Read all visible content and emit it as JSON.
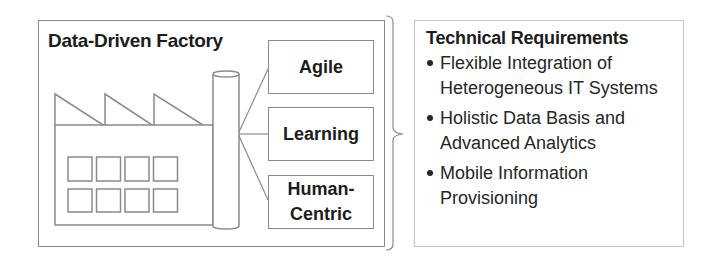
{
  "factory": {
    "title": "Data-Driven Factory",
    "icon": "factory-icon",
    "characteristics": [
      {
        "label": "Agile"
      },
      {
        "label": "Learning"
      },
      {
        "label": "Human-\nCentric"
      }
    ]
  },
  "requirements": {
    "title": "Technical Requirements",
    "items": [
      {
        "text": "Flexible Integration of Heterogeneous IT Systems"
      },
      {
        "text": "Holistic Data Basis and Advanced Analytics"
      },
      {
        "text": "Mobile Information Provisioning"
      }
    ]
  },
  "colors": {
    "stroke": "#8a8a8a",
    "text": "#1c1c1c",
    "background": "#ffffff"
  }
}
